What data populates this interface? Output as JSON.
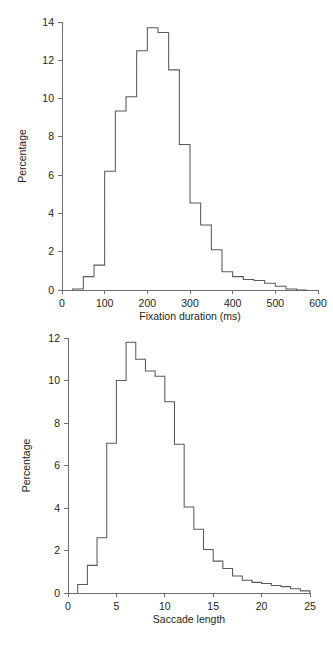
{
  "figure": {
    "background": "#ffffff",
    "line_color": "#58595b",
    "axis_color": "#6d6e70",
    "text_color": "#231f20"
  },
  "chart_data": [
    {
      "id": "fixation-duration-histogram",
      "type": "bar",
      "title": "",
      "subtitle": "",
      "xlabel": "Fixation duration (ms)",
      "ylabel": "Percentage",
      "xlim": [
        0,
        600
      ],
      "ylim": [
        0,
        14
      ],
      "xticks": [
        0,
        100,
        200,
        300,
        400,
        500,
        600
      ],
      "xtick_labels": [
        "0",
        "100",
        "200",
        "300",
        "400",
        "500",
        "600"
      ],
      "yticks": [
        0,
        2,
        4,
        6,
        8,
        10,
        12,
        14
      ],
      "ytick_labels": [
        "0",
        "2",
        "4",
        "6",
        "8",
        "10",
        "12",
        "14"
      ],
      "grid": false,
      "legend": "none",
      "bin_width": 25,
      "bin_starts": [
        25,
        50,
        75,
        100,
        125,
        150,
        175,
        200,
        225,
        250,
        275,
        300,
        325,
        350,
        375,
        400,
        425,
        450,
        475,
        500,
        525,
        550
      ],
      "values": [
        0.05,
        0.7,
        1.3,
        6.2,
        9.35,
        10.1,
        12.5,
        13.7,
        13.45,
        11.5,
        7.6,
        4.55,
        3.4,
        2.1,
        0.95,
        0.7,
        0.55,
        0.5,
        0.35,
        0.2,
        0.05,
        0.0
      ],
      "categories": [
        "25-50",
        "50-75",
        "75-100",
        "100-125",
        "125-150",
        "150-175",
        "175-200",
        "200-225",
        "225-250",
        "250-275",
        "275-300",
        "300-325",
        "325-350",
        "350-375",
        "375-400",
        "400-425",
        "425-450",
        "450-475",
        "475-500",
        "500-525",
        "525-550",
        "550-575"
      ]
    },
    {
      "id": "saccade-length-histogram",
      "type": "bar",
      "title": "",
      "subtitle": "",
      "xlabel": "Saccade length",
      "ylabel": "Percentage",
      "xlim": [
        0,
        25
      ],
      "ylim": [
        0,
        12
      ],
      "xticks": [
        0,
        5,
        10,
        15,
        20,
        25
      ],
      "xtick_labels": [
        "0",
        "5",
        "10",
        "15",
        "20",
        "25"
      ],
      "yticks": [
        0,
        2,
        4,
        6,
        8,
        10,
        12
      ],
      "ytick_labels": [
        "0",
        "2",
        "4",
        "6",
        "8",
        "10",
        "12"
      ],
      "grid": false,
      "legend": "none",
      "bin_width": 1,
      "bin_starts": [
        1,
        2,
        3,
        4,
        5,
        6,
        7,
        8,
        9,
        10,
        11,
        12,
        13,
        14,
        15,
        16,
        17,
        18,
        19,
        20,
        21,
        22,
        23,
        24
      ],
      "values": [
        0.4,
        1.3,
        2.6,
        7.05,
        10.0,
        11.8,
        11.0,
        10.45,
        10.2,
        9.0,
        7.0,
        4.05,
        3.0,
        2.05,
        1.5,
        1.15,
        0.8,
        0.6,
        0.5,
        0.45,
        0.35,
        0.3,
        0.2,
        0.1
      ],
      "categories": [
        "1-2",
        "2-3",
        "3-4",
        "4-5",
        "5-6",
        "6-7",
        "7-8",
        "8-9",
        "9-10",
        "10-11",
        "11-12",
        "12-13",
        "13-14",
        "14-15",
        "15-16",
        "16-17",
        "17-18",
        "18-19",
        "19-20",
        "20-21",
        "21-22",
        "22-23",
        "23-24",
        "24-25"
      ]
    }
  ]
}
